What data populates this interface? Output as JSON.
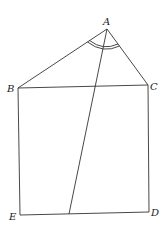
{
  "diagram": {
    "labels": {
      "A": "A",
      "B": "B",
      "C": "C",
      "D": "D",
      "E": "E"
    },
    "points": {
      "A": [
        107,
        29
      ],
      "B": [
        18,
        88
      ],
      "C": [
        148,
        85
      ],
      "D": [
        149,
        212
      ],
      "E": [
        20,
        215
      ],
      "F": [
        69,
        214
      ]
    },
    "stroke_color": "#333333",
    "angle_mark": "double arc at A"
  }
}
